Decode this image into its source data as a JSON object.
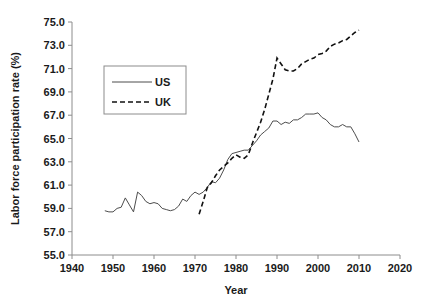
{
  "chart_data": {
    "type": "line",
    "title": "",
    "xlabel": "Year",
    "ylabel": "Labor force participation rate (%)",
    "xlim": [
      1940,
      2020
    ],
    "ylim": [
      55.0,
      75.0
    ],
    "xticks": [
      1940,
      1950,
      1960,
      1970,
      1980,
      1990,
      2000,
      2010,
      2020
    ],
    "xtick_labels": [
      "1940",
      "1950",
      "1960",
      "1970",
      "1980",
      "1990",
      "2000",
      "2010",
      "2020"
    ],
    "yticks": [
      55.0,
      57.0,
      59.0,
      61.0,
      63.0,
      65.0,
      67.0,
      69.0,
      71.0,
      73.0,
      75.0
    ],
    "ytick_labels": [
      "55.0",
      "57.0",
      "59.0",
      "61.0",
      "63.0",
      "65.0",
      "67.0",
      "69.0",
      "71.0",
      "73.0",
      "75.0"
    ],
    "grid": false,
    "legend_position": "upper-left-inside",
    "series": [
      {
        "name": "US",
        "style": "solid",
        "color": "#4d4d4d",
        "x": [
          1948,
          1949,
          1950,
          1951,
          1952,
          1953,
          1954,
          1955,
          1956,
          1957,
          1958,
          1959,
          1960,
          1961,
          1962,
          1963,
          1964,
          1965,
          1966,
          1967,
          1968,
          1969,
          1970,
          1971,
          1972,
          1973,
          1974,
          1975,
          1976,
          1977,
          1978,
          1979,
          1980,
          1981,
          1982,
          1983,
          1984,
          1985,
          1986,
          1987,
          1988,
          1989,
          1990,
          1991,
          1992,
          1993,
          1994,
          1995,
          1996,
          1997,
          1998,
          1999,
          2000,
          2001,
          2002,
          2003,
          2004,
          2005,
          2006,
          2007,
          2008,
          2009,
          2010
        ],
        "values": [
          58.8,
          58.7,
          58.7,
          59.0,
          59.1,
          59.9,
          59.3,
          58.7,
          60.4,
          60.1,
          59.6,
          59.4,
          59.5,
          59.4,
          59.0,
          58.9,
          58.8,
          58.9,
          59.2,
          59.8,
          59.6,
          60.1,
          60.4,
          60.2,
          60.4,
          60.8,
          61.3,
          61.2,
          61.6,
          62.3,
          63.2,
          63.7,
          63.8,
          63.9,
          64.0,
          64.0,
          64.4,
          64.8,
          65.3,
          65.6,
          65.9,
          66.5,
          66.5,
          66.2,
          66.4,
          66.3,
          66.6,
          66.6,
          66.8,
          67.1,
          67.1,
          67.1,
          67.2,
          66.8,
          66.6,
          66.2,
          66.0,
          66.0,
          66.2,
          66.0,
          66.0,
          65.4,
          64.7
        ]
      },
      {
        "name": "UK",
        "style": "dashed",
        "color": "#111111",
        "x": [
          1971,
          1972,
          1973,
          1974,
          1975,
          1976,
          1977,
          1978,
          1979,
          1980,
          1981,
          1982,
          1983,
          1984,
          1985,
          1986,
          1987,
          1988,
          1989,
          1990,
          1991,
          1992,
          1993,
          1994,
          1995,
          1996,
          1997,
          1998,
          1999,
          2000,
          2001,
          2002,
          2003,
          2004,
          2005,
          2006,
          2007,
          2008,
          2009,
          2010
        ],
        "values": [
          58.5,
          59.6,
          60.8,
          61.2,
          61.8,
          62.3,
          62.6,
          62.9,
          63.3,
          63.6,
          63.4,
          63.3,
          63.6,
          64.6,
          65.5,
          66.4,
          67.5,
          68.8,
          70.1,
          71.9,
          71.4,
          70.9,
          70.8,
          70.8,
          71.0,
          71.4,
          71.6,
          71.8,
          71.9,
          72.2,
          72.3,
          72.5,
          72.9,
          73.1,
          73.2,
          73.4,
          73.5,
          73.8,
          74.1,
          74.3
        ]
      }
    ]
  },
  "legend": {
    "entries": [
      {
        "label": "US",
        "style": "solid"
      },
      {
        "label": "UK",
        "style": "dashed"
      }
    ]
  }
}
